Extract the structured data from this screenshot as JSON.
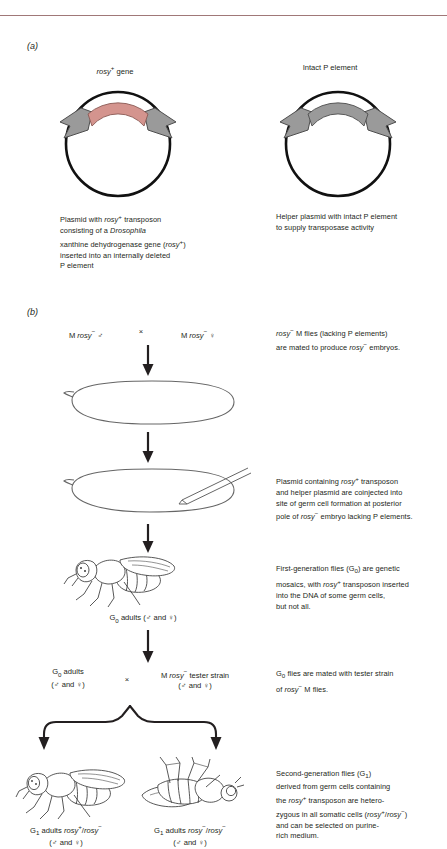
{
  "figure": {
    "panel_a_letter": "(a)",
    "panel_b_letter": "(b)"
  },
  "panel_a": {
    "left_plasmid": {
      "title": "rosy+ gene",
      "title_main": "rosy",
      "title_sup": "+",
      "title_tail": " gene",
      "caption_lines": [
        "Plasmid with rosy+ transposon",
        "consisting of a Drosophila",
        "xanthine dehydrogenase gene (rosy+)",
        "inserted into an internally deleted",
        "P element"
      ],
      "segment_color": "#d4948e",
      "arrow_color": "#9a9a9a"
    },
    "right_plasmid": {
      "title": "Intact P element",
      "caption_lines": [
        "Helper plasmid with intact P element",
        "to supply transposase activity"
      ],
      "arrow_color": "#9a9a9a"
    }
  },
  "panel_b": {
    "steps": [
      {
        "id": "cross-1",
        "left_label": "M rosy− ♂",
        "cross_symbol": "×",
        "right_label": "M rosy− ♀",
        "caption_lines": [
          "rosy− M flies (lacking P elements)",
          "are mated to produce rosy− embryos."
        ]
      },
      {
        "id": "embryo-plain",
        "caption_lines": []
      },
      {
        "id": "embryo-injected",
        "caption_lines": [
          "Plasmid containing rosy+ transposon",
          "and helper plasmid are coinjected into",
          "site of germ cell formation at posterior",
          "pole of rosy− embryo lacking P elements."
        ]
      },
      {
        "id": "g0-fly",
        "label": "G0 adults (♂ and ♀)",
        "caption_lines": [
          "First-generation flies (G0) are genetic",
          "mosaics, with rosy+ transposon inserted",
          "into the DNA of some germ cells,",
          "but not all."
        ]
      },
      {
        "id": "cross-2",
        "left_label_line1": "G0 adults",
        "left_label_line2": "(♂ and ♀)",
        "cross_symbol": "×",
        "right_label_line1": "M rosy− tester strain",
        "right_label_line2": "(♂ and ♀)",
        "caption_lines": [
          "G0 flies are mated with tester strain",
          "of rosy− M flies."
        ]
      },
      {
        "id": "g1-flies",
        "left_fly_label_line1": "G1 adults rosy+/rosy−",
        "left_fly_label_line2": "(♂ and ♀)",
        "right_fly_label_line1": "G1 adults rosy−/rosy−",
        "right_fly_label_line2": "(♂ and ♀)",
        "caption_lines": [
          "Second-generation flies (G1)",
          "derived from germ cells containing",
          "the rosy+ transposon are hetero-",
          "zygous in all somatic cells (rosy+/rosy−)",
          "and can be selected on purine-",
          "rich medium."
        ]
      }
    ]
  },
  "colors": {
    "rule": "#a07878",
    "ink": "#231f20",
    "line": "#555555",
    "pink": "#d4948e",
    "gray_arrow": "#9a9a9a"
  }
}
